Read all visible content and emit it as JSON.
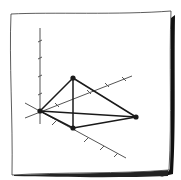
{
  "diagram": {
    "type": "hand-drawn 3D coordinate sketch",
    "colors": {
      "ink": "#1a1a1a",
      "axis": "#555555",
      "paper": "#ffffff",
      "shadow": "#111111"
    },
    "paper": {
      "outline": "M11,14 C50,12 120,15 171,11 C169,60 172,120 169,170 C120,174 60,172 12,175 C13,120 9,60 11,14 Z",
      "shadow": "M171,18 L175,15 C174,70 176,130 173,174 L160,177 C166,175 170,170 170,168 C172,120 170,60 171,18 Z",
      "bottom_shadow": "M14,175 C60,173 120,174 168,170 L168,176 C120,178 60,177 14,176 Z"
    },
    "axes": [
      {
        "name": "vertical-axis",
        "x1": 40,
        "y1": 28,
        "x2": 40,
        "y2": 124,
        "ticks": [
          [
            38,
            42,
            42,
            40
          ],
          [
            38,
            59,
            42,
            57
          ],
          [
            38,
            77,
            42,
            75
          ],
          [
            38,
            95,
            42,
            93
          ]
        ]
      },
      {
        "name": "depth-axis",
        "x1": 25,
        "y1": 118,
        "x2": 132,
        "y2": 76,
        "ticks": [
          [
            55,
            103,
            59,
            107
          ],
          [
            87,
            90,
            91,
            94
          ],
          [
            105,
            83,
            109,
            87
          ],
          [
            122,
            77,
            126,
            81
          ]
        ]
      },
      {
        "name": "horizontal-axis",
        "x1": 25,
        "y1": 103,
        "x2": 126,
        "y2": 158,
        "ticks": [
          [
            56,
            121,
            52,
            125
          ],
          [
            88,
            138,
            84,
            142
          ],
          [
            104,
            146,
            100,
            150
          ],
          [
            118,
            153,
            114,
            157
          ]
        ]
      }
    ],
    "vertices": [
      {
        "name": "origin",
        "x": 40,
        "y": 111
      },
      {
        "name": "apex",
        "x": 73,
        "y": 78
      },
      {
        "name": "front",
        "x": 73,
        "y": 128
      },
      {
        "name": "right",
        "x": 136,
        "y": 117
      }
    ],
    "edges": [
      [
        "origin",
        "apex"
      ],
      [
        "origin",
        "front"
      ],
      [
        "origin",
        "right"
      ],
      [
        "apex",
        "front"
      ],
      [
        "apex",
        "right"
      ],
      [
        "front",
        "right"
      ]
    ]
  }
}
